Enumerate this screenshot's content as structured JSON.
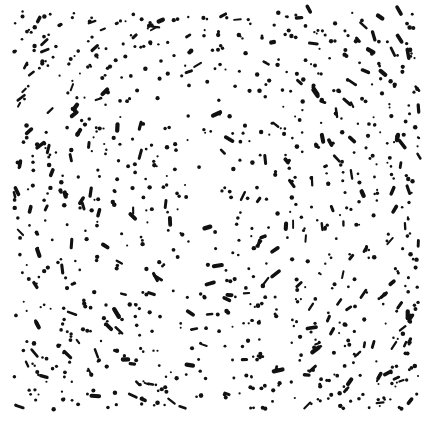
{
  "figure": {
    "title": "Radial stipple dot field",
    "type": "stipple-point-field",
    "width": 430,
    "height": 426,
    "background_color": "#ffffff",
    "dot_color": "#111111",
    "caption": ""
  },
  "chart_data": {
    "type": "scatter",
    "title": "Radial stipple dot field",
    "subtitle": "",
    "xlabel": "",
    "ylabel": "",
    "xlim": [
      0,
      430
    ],
    "ylim": [
      0,
      426
    ],
    "grid": false,
    "legend": false,
    "axes_visible": false,
    "tick_labels_x": [],
    "tick_labels_y": [],
    "annotations": [],
    "series": [
      {
        "name": "stipple-points",
        "marker": "dot",
        "color": "#111111",
        "point_count": 1450,
        "marker_size_px": [
          2,
          5
        ]
      }
    ],
    "generation": {
      "model": "radial-concentric-stipple",
      "center_x": 212,
      "center_y": 198,
      "plot_left": 14,
      "plot_top": 9,
      "plot_right": 419,
      "plot_bottom": 410,
      "ring_spacing_px": 16.5,
      "ring_jitter_px": 3.4,
      "angular_jitter_rad": 0.055,
      "density_center": 0.34,
      "density_edge": 1.0,
      "density_falloff_exponent": 1.55,
      "dash_probability": 0.2,
      "dash_length_px": [
        4,
        9
      ],
      "dot_radius_px": [
        1.0,
        2.3
      ],
      "random_seed": 20240517,
      "extra_uniform_points": 300
    }
  }
}
